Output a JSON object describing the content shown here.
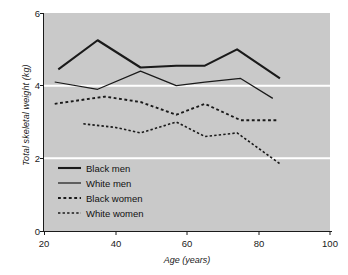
{
  "chart_data": {
    "type": "line",
    "title": "",
    "xlabel": "Age (years)",
    "ylabel": "Total skeletal weight (kg)",
    "xlim": [
      20,
      100
    ],
    "ylim": [
      0,
      6
    ],
    "xticks": [
      "20",
      "40",
      "60",
      "80",
      "100"
    ],
    "xtick_values": [
      20,
      40,
      60,
      80,
      100
    ],
    "yticks": [
      "0",
      "2",
      "4",
      "6"
    ],
    "ytick_values": [
      0,
      2,
      4,
      6
    ],
    "grid": "horizontal gridlines in white at y = 2 and y = 4; panel has light grey background",
    "legend_position": "lower left inside panel",
    "series": [
      {
        "name": "Black men",
        "style": "solid",
        "width": 2.1,
        "color": "#1a1a1a",
        "x": [
          24,
          35,
          47,
          57,
          65,
          74,
          86
        ],
        "values": [
          4.45,
          5.25,
          4.5,
          4.55,
          4.55,
          5.0,
          4.2
        ]
      },
      {
        "name": "White men",
        "style": "solid",
        "width": 1.2,
        "color": "#1a1a1a",
        "x": [
          23,
          35,
          47,
          57,
          65,
          75,
          84
        ],
        "values": [
          4.1,
          3.9,
          4.4,
          4.0,
          4.1,
          4.2,
          3.65
        ]
      },
      {
        "name": "Black women",
        "style": "dashed",
        "width": 1.9,
        "color": "#1a1a1a",
        "x": [
          23,
          37,
          47,
          57,
          65,
          75,
          85
        ],
        "values": [
          3.5,
          3.7,
          3.55,
          3.2,
          3.5,
          3.05,
          3.05
        ]
      },
      {
        "name": "White women",
        "style": "dashed",
        "width": 1.6,
        "color": "#1a1a1a",
        "x": [
          31,
          40,
          47,
          57,
          65,
          74,
          86
        ],
        "values": [
          2.95,
          2.85,
          2.7,
          3.0,
          2.6,
          2.7,
          1.85
        ]
      }
    ],
    "colors": {
      "panel_background": "#c9c9c9",
      "gridline": "#ffffff",
      "axis": "#1a1a1a",
      "line": "#1a1a1a",
      "figure_background": "#ffffff"
    }
  },
  "legend": {
    "items": [
      {
        "label": "Black men"
      },
      {
        "label": "White men"
      },
      {
        "label": "Black women"
      },
      {
        "label": "White women"
      }
    ]
  },
  "axes": {
    "y_title": "Total skeletal weight (kg)",
    "x_title": "Age (years)",
    "y_tick_labels": [
      "6",
      "4",
      "2",
      "0"
    ],
    "x_tick_labels": [
      "20",
      "40",
      "60",
      "80",
      "100"
    ]
  }
}
